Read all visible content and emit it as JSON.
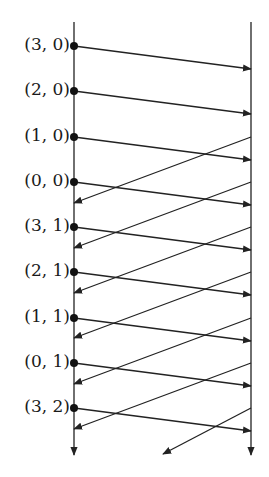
{
  "diagram": {
    "type": "message-sequence",
    "left_axis_x": 74,
    "right_axis_x": 251,
    "axis_top": 22,
    "axis_bottom": 455,
    "stroke_color": "#222222",
    "events": [
      {
        "label": "(3, 0)",
        "y": 46
      },
      {
        "label": "(2, 0)",
        "y": 91
      },
      {
        "label": "(1, 0)",
        "y": 137
      },
      {
        "label": "(0, 0)",
        "y": 182
      },
      {
        "label": "(3, 1)",
        "y": 227
      },
      {
        "label": "(2, 1)",
        "y": 272
      },
      {
        "label": "(1, 1)",
        "y": 318
      },
      {
        "label": "(0, 1)",
        "y": 363
      },
      {
        "label": "(3, 2)",
        "y": 408
      }
    ],
    "forward_drop": 23,
    "return_drop": 66,
    "return_start_index": 2,
    "last_return_end": {
      "x": 163,
      "y": 454
    }
  }
}
